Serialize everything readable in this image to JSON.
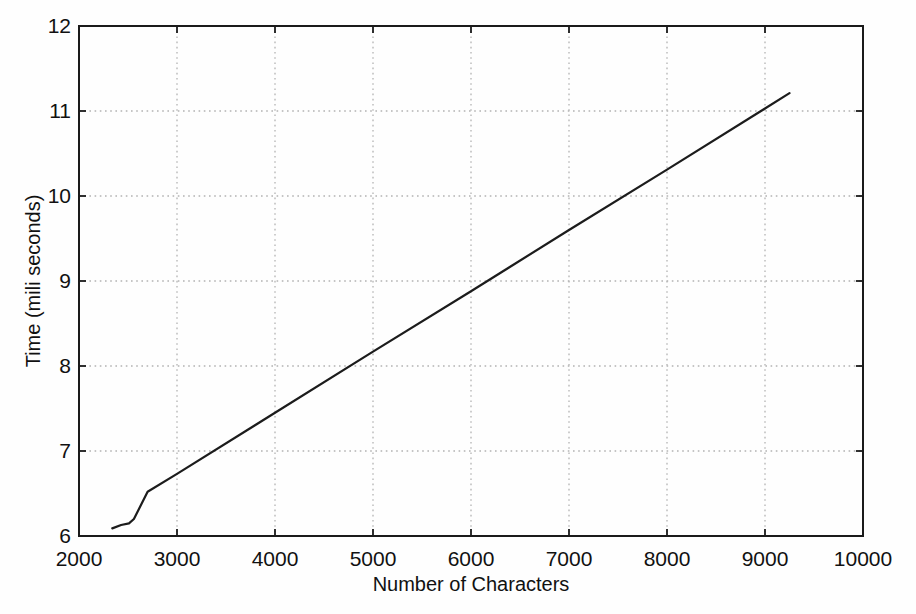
{
  "figure": {
    "background": "#fefefe"
  },
  "chart_data": {
    "type": "line",
    "title": "",
    "xlabel": "Number of Characters",
    "ylabel": "Time (mili seconds)",
    "xlim": [
      2000,
      10000
    ],
    "ylim": [
      6,
      12
    ],
    "xticks": [
      2000,
      3000,
      4000,
      5000,
      6000,
      7000,
      8000,
      9000,
      10000
    ],
    "yticks": [
      6,
      7,
      8,
      9,
      10,
      11,
      12
    ],
    "grid": "dotted",
    "legend": "none",
    "axis_color": "#1a1a1a",
    "grid_color": "#b3b3b3",
    "text_color": "#111111",
    "series": [
      {
        "name": "time-vs-characters",
        "color": "#1c1c1c",
        "points": [
          [
            2340,
            6.09
          ],
          [
            2430,
            6.13
          ],
          [
            2510,
            6.15
          ],
          [
            2560,
            6.2
          ],
          [
            2700,
            6.52
          ],
          [
            3000,
            6.73
          ],
          [
            4000,
            7.45
          ],
          [
            5000,
            8.17
          ],
          [
            6000,
            8.88
          ],
          [
            7000,
            9.6
          ],
          [
            8000,
            10.31
          ],
          [
            9000,
            11.03
          ],
          [
            9250,
            11.21
          ]
        ]
      }
    ]
  }
}
